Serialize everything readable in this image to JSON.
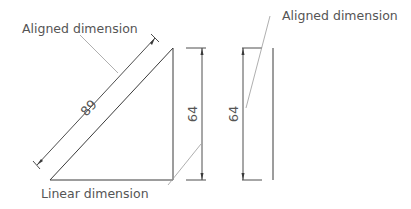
{
  "diagram": {
    "title": "",
    "callouts": {
      "aligned_left": "Aligned dimension",
      "aligned_right": "Aligned dimension",
      "linear": "Linear dimension"
    },
    "dimensions": {
      "hypotenuse": "89",
      "triangle_height": "64",
      "line_height": "64"
    },
    "colors": {
      "geometry": "#3a3a3a",
      "leader": "#9a9a9a",
      "text": "#555555",
      "background": "#ffffff"
    }
  }
}
